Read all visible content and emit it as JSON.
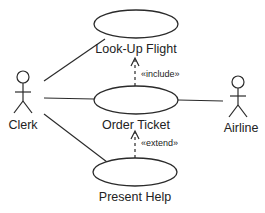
{
  "diagram": {
    "type": "uml-use-case",
    "colors": {
      "stroke": "#2a2a2a",
      "text": "#222222",
      "background": "#ffffff"
    },
    "actors": [
      {
        "id": "clerk",
        "label": "Clerk"
      },
      {
        "id": "airline",
        "label": "Airline"
      }
    ],
    "use_cases": [
      {
        "id": "lookup-flight",
        "label": "Look-Up Flight"
      },
      {
        "id": "order-ticket",
        "label": "Order Ticket"
      },
      {
        "id": "present-help",
        "label": "Present Help"
      }
    ],
    "relationships": [
      {
        "from": "clerk",
        "to": "lookup-flight",
        "kind": "association"
      },
      {
        "from": "clerk",
        "to": "order-ticket",
        "kind": "association"
      },
      {
        "from": "clerk",
        "to": "present-help",
        "kind": "association"
      },
      {
        "from": "order-ticket",
        "to": "airline",
        "kind": "association"
      },
      {
        "from": "order-ticket",
        "to": "lookup-flight",
        "kind": "include",
        "label": "«include»"
      },
      {
        "from": "present-help",
        "to": "order-ticket",
        "kind": "extend",
        "label": "«extend»"
      }
    ]
  }
}
